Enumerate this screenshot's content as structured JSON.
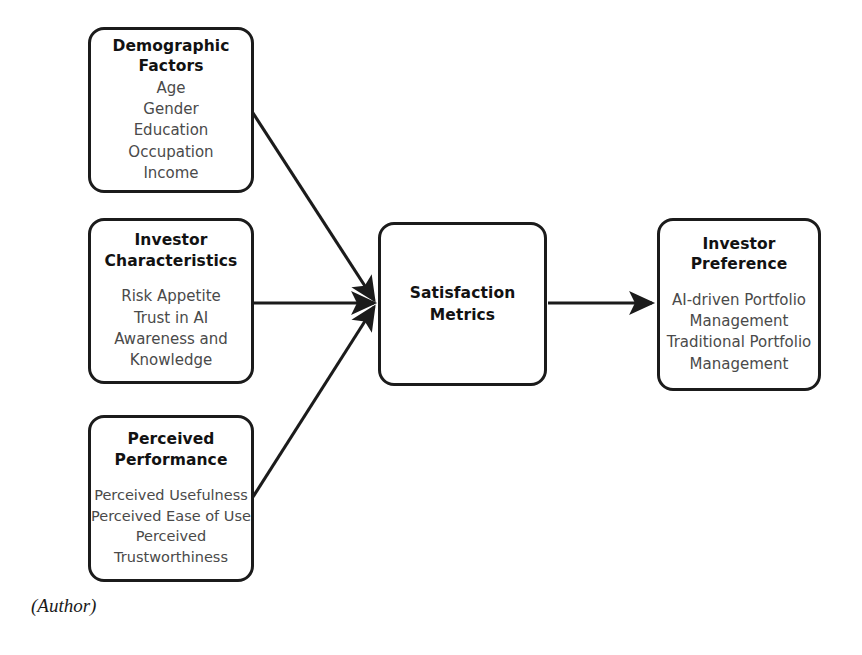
{
  "diagram": {
    "type": "conceptual-framework",
    "caption": "(Author)",
    "nodes": {
      "demographic": {
        "title_line1": "Demographic",
        "title_line2": "Factors",
        "items": [
          "Age",
          "Gender",
          "Education",
          "Occupation",
          "Income"
        ]
      },
      "investor_characteristics": {
        "title_line1": "Investor",
        "title_line2": "Characteristics",
        "items": [
          "Risk Appetite",
          "Trust in AI",
          "Awareness and",
          "Knowledge"
        ]
      },
      "perceived_performance": {
        "title_line1": "Perceived",
        "title_line2": "Performance",
        "items": [
          "Perceived Usefulness",
          "Perceived Ease of Use",
          "Perceived",
          "Trustworthiness"
        ]
      },
      "satisfaction": {
        "title_line1": "Satisfaction",
        "title_line2": "Metrics",
        "items": []
      },
      "investor_preference": {
        "title_line1": "Investor",
        "title_line2": "Preference",
        "items": [
          "AI-driven Portfolio",
          "Management",
          "Traditional Portfolio",
          "Management"
        ]
      }
    },
    "edges": [
      {
        "from": "demographic",
        "to": "satisfaction",
        "style": "diagonal-down"
      },
      {
        "from": "investor_characteristics",
        "to": "satisfaction",
        "style": "straight"
      },
      {
        "from": "perceived_performance",
        "to": "satisfaction",
        "style": "diagonal-up"
      },
      {
        "from": "satisfaction",
        "to": "investor_preference",
        "style": "straight"
      }
    ],
    "colors": {
      "box_border": "#1b1b1b",
      "box_fill": "#ffffff",
      "title_text": "#121212",
      "item_text": "#4a4a4a",
      "arrow": "#1b1b1b",
      "background": "#ffffff"
    }
  }
}
